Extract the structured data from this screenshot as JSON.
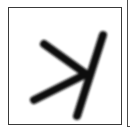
{
  "sample": {
    "description": "Handwritten character glyph in a bordered cell",
    "label": "handwritten symbol",
    "stroke_color": "#111111",
    "border_color": "#3a3a3a",
    "background": "#ffffff",
    "strokes": [
      {
        "from": [
          44,
          44
        ],
        "to": [
          86,
          74
        ]
      },
      {
        "from": [
          34,
          100
        ],
        "to": [
          86,
          74
        ]
      },
      {
        "from": [
          103,
          35
        ],
        "to": [
          77,
          116
        ]
      }
    ]
  }
}
